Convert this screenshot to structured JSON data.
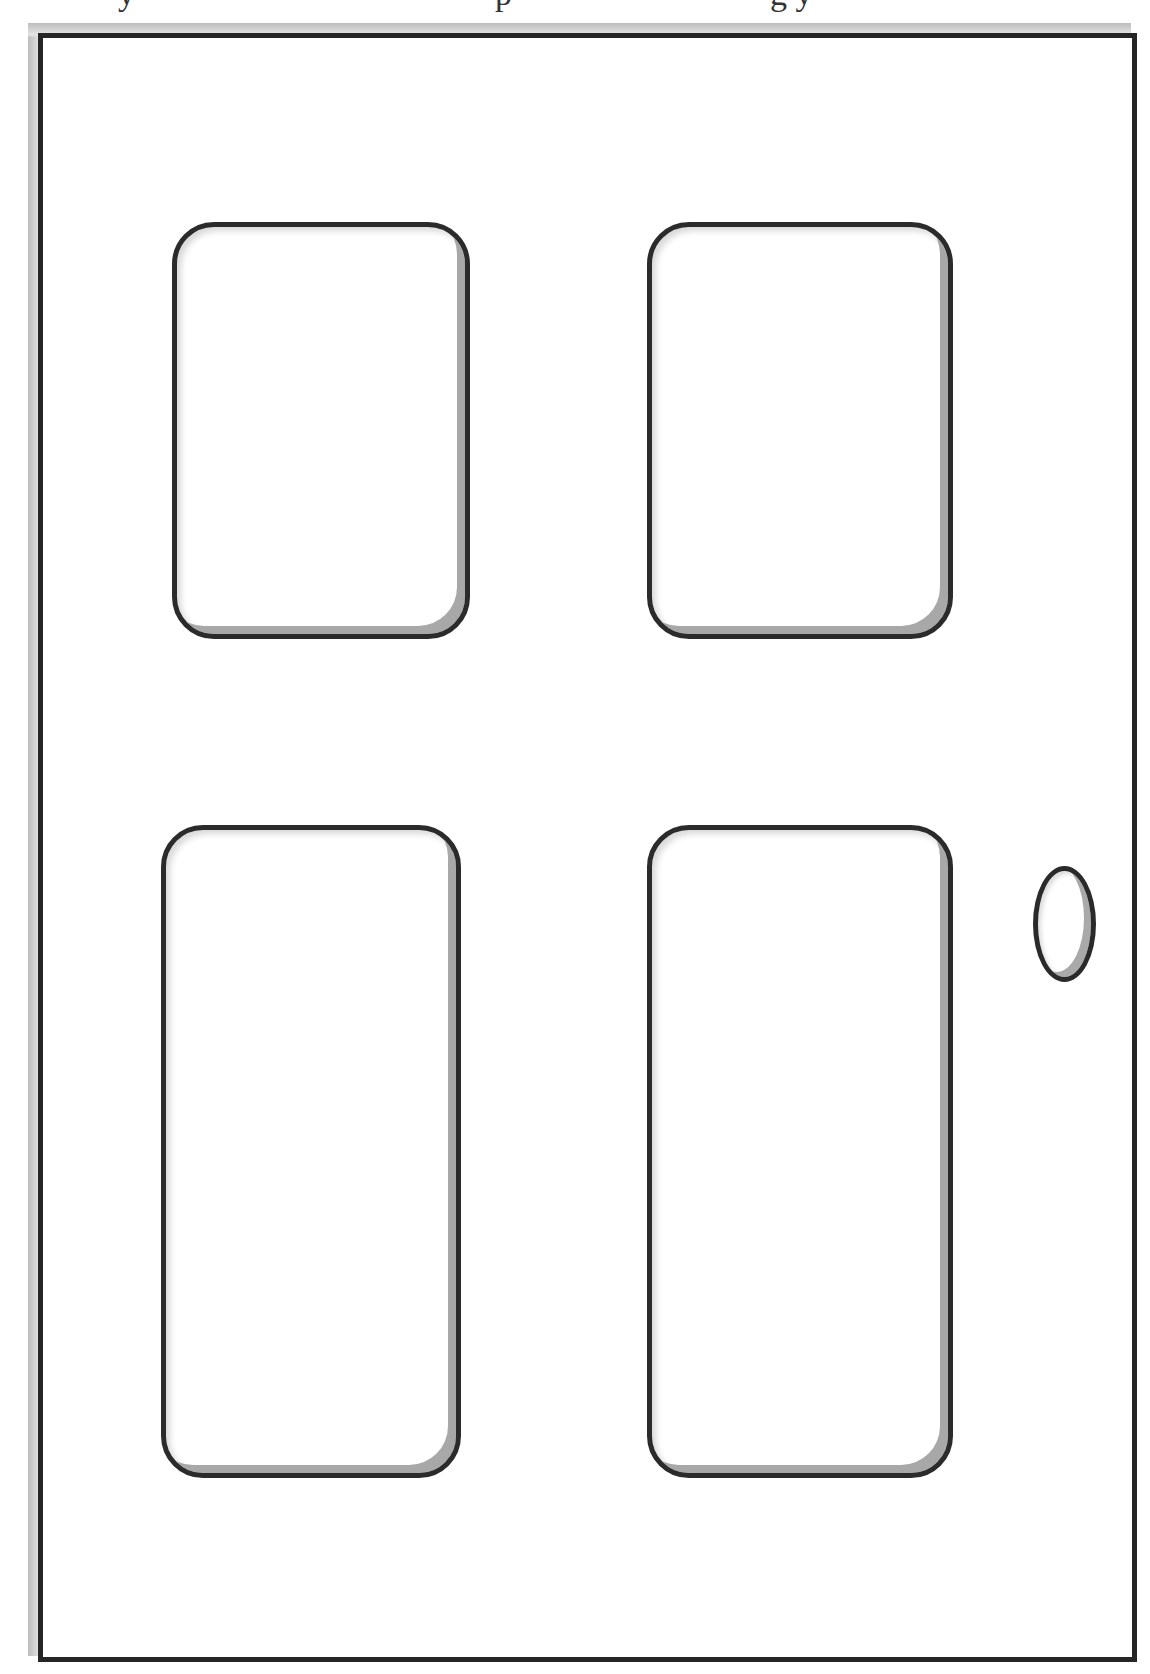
{
  "scene": {
    "description": "line drawing of a four-panel door with an oval knob",
    "top_text_fragment": "y                        p                        g y",
    "colors": {
      "background": "#ffffff",
      "outline": "#262626",
      "panel_shadow": "#a8a8a8"
    }
  },
  "door": {
    "panels": [
      {
        "name": "top-left",
        "x": 172,
        "y": 222,
        "w": 298,
        "h": 417
      },
      {
        "name": "top-right",
        "x": 647,
        "y": 222,
        "w": 306,
        "h": 417
      },
      {
        "name": "bottom-left",
        "x": 161,
        "y": 825,
        "w": 300,
        "h": 653
      },
      {
        "name": "bottom-right",
        "x": 647,
        "y": 825,
        "w": 306,
        "h": 653
      }
    ],
    "knob": {
      "x": 1033,
      "y": 866,
      "w": 63,
      "h": 116
    }
  }
}
